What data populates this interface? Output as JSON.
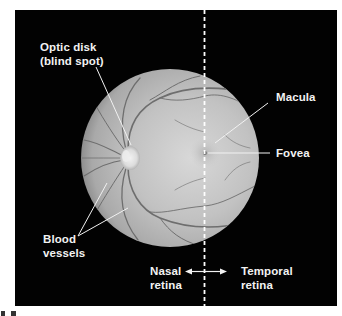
{
  "figure": {
    "background_color": "#000000",
    "page_color": "#ffffff",
    "fundus_color": "#bdbdbd",
    "label_color": "#f2f2f2",
    "elements": {
      "optic_disk": {
        "line1": "Optic disk",
        "line2": "(blind spot)"
      },
      "macula": {
        "label": "Macula"
      },
      "fovea": {
        "label": "Fovea"
      },
      "blood_vessels": {
        "line1": "Blood",
        "line2": "vessels"
      },
      "nasal_retina": {
        "line1": "Nasal",
        "line2": "retina"
      },
      "temporal_retina": {
        "line1": "Temporal",
        "line2": "retina"
      },
      "divider": {
        "style": "dashed",
        "orientation": "vertical"
      },
      "direction_arrow": {
        "type": "double-headed",
        "orientation": "horizontal"
      }
    }
  }
}
